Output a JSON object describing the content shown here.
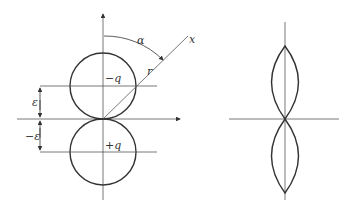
{
  "diagram": {
    "left_panel": {
      "labels": {
        "alpha": "α",
        "x_axis": "x",
        "radius": "r",
        "upper_charge": "−q",
        "lower_charge": "+q",
        "epsilon_pos": "ε",
        "epsilon_neg": "−ε"
      },
      "description": "Two tangent circles representing dipole pattern; charges -q above and +q below, separated by ±ε from origin; radial line r at angle α from vertical axis"
    },
    "right_panel": {
      "description": "Two lens-shaped lobes along vertical axis meeting at origin"
    },
    "colors": {
      "stroke": "#333333",
      "thin_stroke": "#555555",
      "background": "#ffffff"
    }
  }
}
